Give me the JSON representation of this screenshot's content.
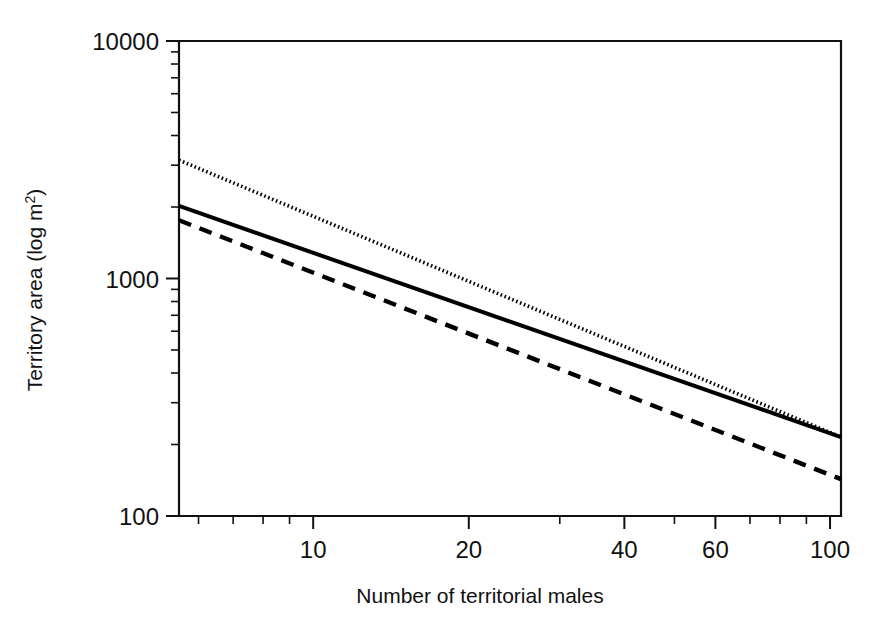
{
  "chart_data": {
    "type": "line",
    "title": "",
    "xlabel": "Number of territorial males",
    "ylabel": "Territory area (log m2)",
    "ylabel_base": "Territory area (log m",
    "ylabel_superscript": "2",
    "ylabel_close": ")",
    "xscale": "log",
    "yscale": "log",
    "xlim": [
      5.5,
      105
    ],
    "ylim": [
      100,
      10000
    ],
    "grid": false,
    "legend": "none",
    "x_tick_labels": [
      "10",
      "20",
      "40",
      "60",
      "100"
    ],
    "x_tick_values": [
      10,
      20,
      40,
      60,
      100
    ],
    "x_minor_ticks": [
      6,
      7,
      8,
      9,
      30,
      50,
      70,
      80,
      90
    ],
    "y_tick_labels": [
      "10000",
      "1000",
      "100"
    ],
    "y_tick_values": [
      10000,
      1000,
      100
    ],
    "y_minor_ticks": [
      200,
      300,
      400,
      500,
      600,
      700,
      800,
      900,
      2000,
      3000,
      4000,
      5000,
      6000,
      7000,
      8000,
      9000
    ],
    "series": [
      {
        "name": "upper-dotted",
        "style": "dotted",
        "color": "#000000",
        "x": [
          5.5,
          105
        ],
        "y": [
          3150,
          215
        ]
      },
      {
        "name": "middle-solid",
        "style": "solid",
        "color": "#000000",
        "x": [
          5.5,
          105
        ],
        "y": [
          2020,
          215
        ]
      },
      {
        "name": "lower-dashed",
        "style": "dashed",
        "color": "#000000",
        "x": [
          5.5,
          105
        ],
        "y": [
          1760,
          143
        ]
      }
    ]
  },
  "figure": {
    "background_color": "#ffffff",
    "foreground_color": "#000000"
  }
}
